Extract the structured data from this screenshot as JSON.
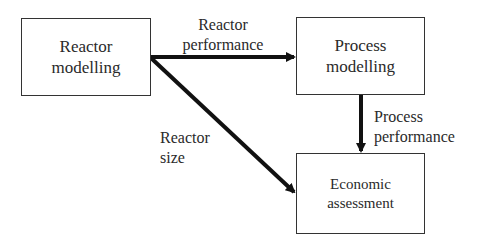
{
  "nodes": {
    "reactor_modelling": {
      "line1": "Reactor",
      "line2": "modelling"
    },
    "process_modelling": {
      "line1": "Process",
      "line2": "modelling"
    },
    "economic_assessment": {
      "line1": "Economic",
      "line2": "assessment"
    }
  },
  "edges": {
    "reactor_performance": {
      "line1": "Reactor",
      "line2": "performance",
      "from": "Reactor modelling",
      "to": "Process modelling"
    },
    "process_performance": {
      "line1": "Process",
      "line2": "performance",
      "from": "Process modelling",
      "to": "Economic assessment"
    },
    "reactor_size": {
      "line1": "Reactor",
      "line2": "size",
      "from": "Reactor modelling",
      "to": "Economic assessment"
    }
  },
  "colors": {
    "stroke": "#111111",
    "box_border": "#333333",
    "text": "#2a2a2a"
  }
}
